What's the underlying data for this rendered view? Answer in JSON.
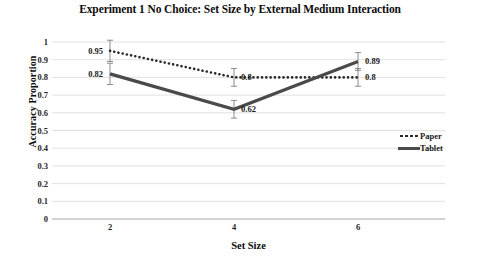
{
  "chart_data": {
    "type": "line",
    "title": "Experiment 1 No Choice: Set Size by External Medium Interaction",
    "title_line1": "Experiment 1 No Choice: Set Size by External Medium",
    "title_line2": "Interaction",
    "xlabel": "Set Size",
    "ylabel": "Accuracy Proportion",
    "categories": [
      "2",
      "4",
      "6"
    ],
    "x": [
      2,
      4,
      6
    ],
    "ylim": [
      0,
      1
    ],
    "ytick_labels": [
      "1",
      "0.9",
      "0.8",
      "0.7",
      "0.6",
      "0.5",
      "0.4",
      "0.3",
      "0.2",
      "0.1",
      "0"
    ],
    "ytick_values": [
      1,
      0.9,
      0.8,
      0.7,
      0.6,
      0.5,
      0.4,
      0.3,
      0.2,
      0.1,
      0
    ],
    "grid": true,
    "legend_position": "right",
    "series": [
      {
        "name": "Paper",
        "style": "dotted",
        "color": "#2b2b2b",
        "values": [
          0.95,
          0.8,
          0.8
        ],
        "labels": [
          "0.95",
          "0.8",
          "0.8"
        ],
        "errors": [
          0.06,
          0.05,
          0.05
        ]
      },
      {
        "name": "Tablet",
        "style": "solid",
        "color": "#4a4a4a",
        "values": [
          0.82,
          0.62,
          0.89
        ],
        "labels": [
          "0.82",
          "0.62",
          "0.89"
        ],
        "errors": [
          0.06,
          0.05,
          0.05
        ]
      }
    ],
    "point_labels": [
      {
        "text": "0.95",
        "series": "Paper",
        "category": "2",
        "value": 0.95,
        "side": "left"
      },
      {
        "text": "0.82",
        "series": "Tablet",
        "category": "2",
        "value": 0.82,
        "side": "left"
      },
      {
        "text": "0.8",
        "series": "Paper",
        "category": "4",
        "value": 0.8,
        "side": "right"
      },
      {
        "text": "0.62",
        "series": "Tablet",
        "category": "4",
        "value": 0.62,
        "side": "right"
      },
      {
        "text": "0.89",
        "series": "Tablet",
        "category": "6",
        "value": 0.89,
        "side": "right"
      },
      {
        "text": "0.8",
        "series": "Paper",
        "category": "6",
        "value": 0.8,
        "side": "right"
      }
    ]
  },
  "legend": {
    "items": [
      {
        "label": "Paper"
      },
      {
        "label": "Tablet"
      }
    ]
  }
}
